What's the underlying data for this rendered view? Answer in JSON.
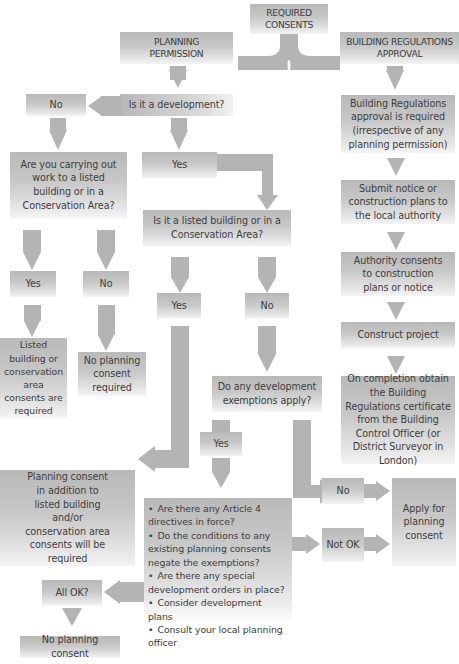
{
  "diagram": {
    "colors": {
      "box_top": "#b9b9b9",
      "box_bottom": "#f4f4f4",
      "arrow": "#b4b4b4",
      "text": "#3d3d3d"
    },
    "nodes": {
      "required_consents": "REQUIRED CONSENTS",
      "planning_permission": "PLANNING PERMISSION",
      "building_regs_approval": "BUILDING REGULATIONS APPROVAL",
      "is_development": "Is it a development?",
      "no_development": "No",
      "yes_development": "Yes",
      "carrying_out_work": "Are you carrying out work to a listed building or in a Conservation Area?",
      "work_yes": "Yes",
      "work_no": "No",
      "listed_consents_required": "Listed building or conservation area consents are required",
      "no_planning_required": "No planning consent required",
      "is_listed": "Is it a listed building or in a Conservation Area?",
      "listed_yes": "Yes",
      "listed_no": "No",
      "exemptions_apply": "Do any development exemptions apply?",
      "exemptions_yes": "Yes",
      "planning_plus_listed": "Planning consent in addition to listed building and/or conservation area consents will be required",
      "checklist": [
        "Are there any Article 4 directives in force?",
        "Do the conditions to any existing planning consents negate the exemptions?",
        "Are there any special development orders in place?",
        "Consider development plans",
        "Consult your local planning officer"
      ],
      "exemptions_no": "No",
      "not_ok": "Not OK",
      "apply_planning": "Apply for planning consent",
      "all_ok": "All OK?",
      "no_planning_consent": "No planning consent",
      "br_required": "Building Regulations approval is required (irrespective of any planning permission)",
      "submit_notice": "Submit notice or construction plans to the local authority",
      "authority_consents": "Authority consents to construction plans or notice",
      "construct_project": "Construct project",
      "on_completion": "On completion obtain the Building Regulations certificate from the Building Control Officer (or District Surveyor in London)"
    }
  }
}
